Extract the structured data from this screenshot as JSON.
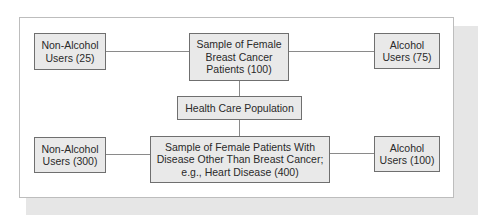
{
  "diagram": {
    "nodes": {
      "breast_cancer_sample": {
        "label": "Sample of Female\nBreast Cancer\nPatients (100)"
      },
      "bc_non_alcohol": {
        "label": "Non-Alcohol\nUsers (25)"
      },
      "bc_alcohol": {
        "label": "Alcohol\nUsers (75)"
      },
      "health_care_population": {
        "label": "Health Care Population"
      },
      "other_disease_sample": {
        "label": "Sample of Female Patients With\nDisease Other Than Breast Cancer;\ne.g., Heart Disease (400)"
      },
      "od_non_alcohol": {
        "label": "Non-Alcohol\nUsers (300)"
      },
      "od_alcohol": {
        "label": "Alcohol\nUsers (100)"
      }
    },
    "edges": [
      {
        "from": "health_care_population",
        "to": "breast_cancer_sample"
      },
      {
        "from": "health_care_population",
        "to": "other_disease_sample"
      },
      {
        "from": "breast_cancer_sample",
        "to": "bc_non_alcohol"
      },
      {
        "from": "breast_cancer_sample",
        "to": "bc_alcohol"
      },
      {
        "from": "other_disease_sample",
        "to": "od_non_alcohol"
      },
      {
        "from": "other_disease_sample",
        "to": "od_alcohol"
      }
    ],
    "colors": {
      "box_fill": "#e9e9e9",
      "box_border": "#6f6f6f",
      "connector": "#8a8a8a",
      "shadow": "#e6e6e6"
    }
  }
}
